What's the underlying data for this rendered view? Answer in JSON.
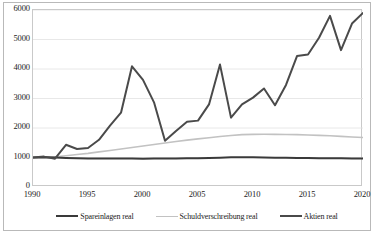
{
  "chart_data": {
    "type": "line",
    "title": "",
    "subtitle": "",
    "xlabel": "",
    "ylabel": "",
    "xlim": [
      1990,
      2020
    ],
    "ylim": [
      0,
      6000
    ],
    "grid": "horizontal",
    "legend_position": "bottom",
    "x_ticks": [
      1990,
      1995,
      2000,
      2005,
      2010,
      2015,
      2020
    ],
    "y_ticks": [
      0,
      1000,
      2000,
      3000,
      4000,
      5000,
      6000
    ],
    "x": [
      1990,
      1991,
      1992,
      1993,
      1994,
      1995,
      1996,
      1997,
      1998,
      1999,
      2000,
      2001,
      2002,
      2003,
      2004,
      2005,
      2006,
      2007,
      2008,
      2009,
      2010,
      2011,
      2012,
      2013,
      2014,
      2015,
      2016,
      2017,
      2018,
      2019,
      2020
    ],
    "series": [
      {
        "name": "Spareinlagen real",
        "color": "#3a3a3a",
        "width": 2.0,
        "values": [
          1000,
          1010,
          1000,
          985,
          975,
          970,
          968,
          966,
          964,
          962,
          960,
          962,
          965,
          968,
          972,
          978,
          985,
          995,
          1005,
          1010,
          1008,
          1000,
          995,
          990,
          985,
          982,
          978,
          975,
          972,
          970,
          968
        ]
      },
      {
        "name": "Schuldverschreibung real",
        "color": "#c2c2c2",
        "width": 1.6,
        "values": [
          1000,
          1005,
          1020,
          1060,
          1100,
          1140,
          1190,
          1240,
          1290,
          1340,
          1390,
          1440,
          1490,
          1540,
          1590,
          1630,
          1670,
          1710,
          1745,
          1775,
          1785,
          1788,
          1785,
          1780,
          1775,
          1765,
          1750,
          1735,
          1715,
          1695,
          1680
        ]
      },
      {
        "name": "Aktien real",
        "color": "#4a4a4a",
        "width": 2.0,
        "values": [
          1000,
          1030,
          960,
          1430,
          1290,
          1320,
          1600,
          2080,
          2520,
          4090,
          3630,
          2870,
          1570,
          1900,
          2210,
          2250,
          2800,
          4150,
          2350,
          2800,
          3030,
          3340,
          2770,
          3460,
          4440,
          4490,
          5060,
          5800,
          4640,
          5540,
          5900
        ]
      }
    ]
  },
  "legend": {
    "items": [
      {
        "label": "Spareinlagen real",
        "color": "#3a3a3a",
        "thickness": "thick"
      },
      {
        "label": "Schuldverschreibung real",
        "color": "#c2c2c2",
        "thickness": "thin"
      },
      {
        "label": "Aktien real",
        "color": "#4a4a4a",
        "thickness": "thick"
      }
    ]
  },
  "axes": {
    "y_tick_labels": [
      "6000",
      "5000",
      "4000",
      "3000",
      "2000",
      "1000",
      "0"
    ],
    "x_tick_labels": [
      "1990",
      "1995",
      "2000",
      "2005",
      "2010",
      "2015",
      "2020"
    ]
  }
}
